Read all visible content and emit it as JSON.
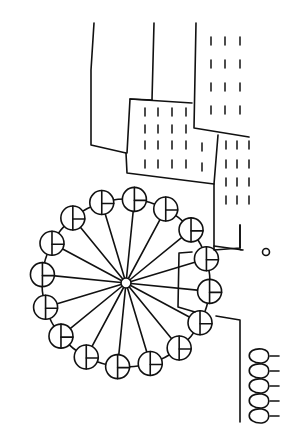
{
  "drawing": {
    "subject": "Line drawing of a ferris wheel beside buildings, rotated 90 degrees",
    "stroke_color": "#111111",
    "background": "#ffffff",
    "wheel": {
      "center": [
        126,
        283
      ],
      "radius": 84,
      "gondola_count": 16,
      "gondola_radius": 12
    },
    "buildings": 4,
    "bushes": 5
  }
}
